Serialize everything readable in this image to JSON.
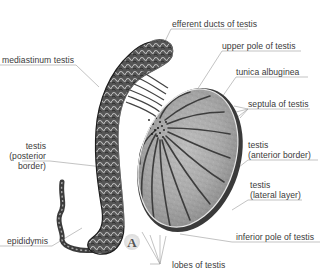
{
  "figure": {
    "panel_letter": "A",
    "colors": {
      "background": "#ffffff",
      "label_text": "#3a3a3a",
      "leader_line": "#9a9a9a",
      "tissue_dark": "#2b2b2b",
      "tissue_mid": "#7a7a7a",
      "tissue_light": "#c8c8c8"
    }
  },
  "labels": {
    "efferent_ducts": "efferent ducts of testis",
    "upper_pole": "upper pole of testis",
    "mediastinum": "mediastinum testis",
    "tunica_albuginea": "tunica albuginea",
    "septula": "septula of testis",
    "anterior_border_line1": "testis",
    "anterior_border_line2": "(anterior border)",
    "posterior_border_line1": "testis",
    "posterior_border_line2": "(posterior",
    "posterior_border_line3": "border)",
    "lateral_layer_line1": "testis",
    "lateral_layer_line2": "(lateral layer)",
    "epididymis": "epididymis",
    "inferior_pole": "inferior pole of testis",
    "lobes": "lobes of testis"
  }
}
